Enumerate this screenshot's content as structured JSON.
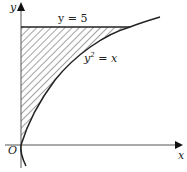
{
  "diagram": {
    "type": "shaded-region-graph",
    "axes": {
      "x_label": "x",
      "y_label": "y",
      "origin_label": "O"
    },
    "curves": [
      {
        "id": "line",
        "label": "y = 5",
        "equation": "y = 5"
      },
      {
        "id": "parabola",
        "label_base": "y",
        "label_exp": "2",
        "label_rest": " = x",
        "equation": "y^2 = x"
      }
    ],
    "shaded_region": "bounded by y-axis, y = 5 and y^2 = x",
    "colors": {
      "stroke": "#222222",
      "axis": "#555555",
      "hatch": "#333333"
    }
  }
}
